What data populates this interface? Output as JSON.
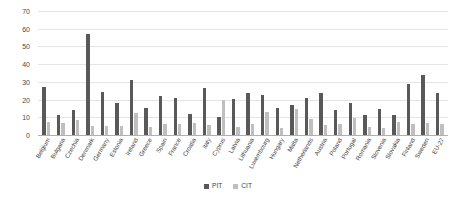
{
  "chart_data": {
    "type": "bar",
    "title": "",
    "subtitle": "",
    "xlabel": "",
    "ylabel": "",
    "ylim": [
      0,
      70
    ],
    "ytick_step": 10,
    "yticks": [
      0,
      10,
      20,
      30,
      40,
      50,
      60,
      70
    ],
    "grid": true,
    "legend_position": "bottom-center",
    "categories": [
      "Belgium",
      "Bulgaria",
      "Czechia",
      "Denmark",
      "Germany",
      "Estonia",
      "Ireland",
      "Greece",
      "Spain",
      "France",
      "Croatia",
      "Italy",
      "Cyprus",
      "Latvia",
      "Lithuania",
      "Luxembourg",
      "Hungary",
      "Malta",
      "Netherlands",
      "Austria",
      "Poland",
      "Portugal",
      "Romania",
      "Slovenia",
      "Slovakia",
      "Finland",
      "Sweden",
      "EU-27"
    ],
    "series": [
      {
        "name": "PIT",
        "color": "#595959",
        "values": [
          27.0,
          11.3,
          14.0,
          57.0,
          24.3,
          18.2,
          31.0,
          15.5,
          22.0,
          21.0,
          12.0,
          26.5,
          10.0,
          20.5,
          24.0,
          22.5,
          15.5,
          17.0,
          21.0,
          23.5,
          14.0,
          18.0,
          11.5,
          14.5,
          11.5,
          29.0,
          34.0,
          24.0
        ]
      },
      {
        "name": "CIT",
        "color": "#bfbfbf",
        "values": [
          7.5,
          7.0,
          8.5,
          5.0,
          5.0,
          5.0,
          12.5,
          4.5,
          6.0,
          6.5,
          7.0,
          5.5,
          19.5,
          4.5,
          6.5,
          13.0,
          4.0,
          14.5,
          9.0,
          5.5,
          6.0,
          9.5,
          4.5,
          4.0,
          7.5,
          6.5,
          7.0,
          6.5
        ]
      }
    ]
  },
  "legend": {
    "items": [
      {
        "label": "PIT"
      },
      {
        "label": "CIT"
      }
    ]
  }
}
